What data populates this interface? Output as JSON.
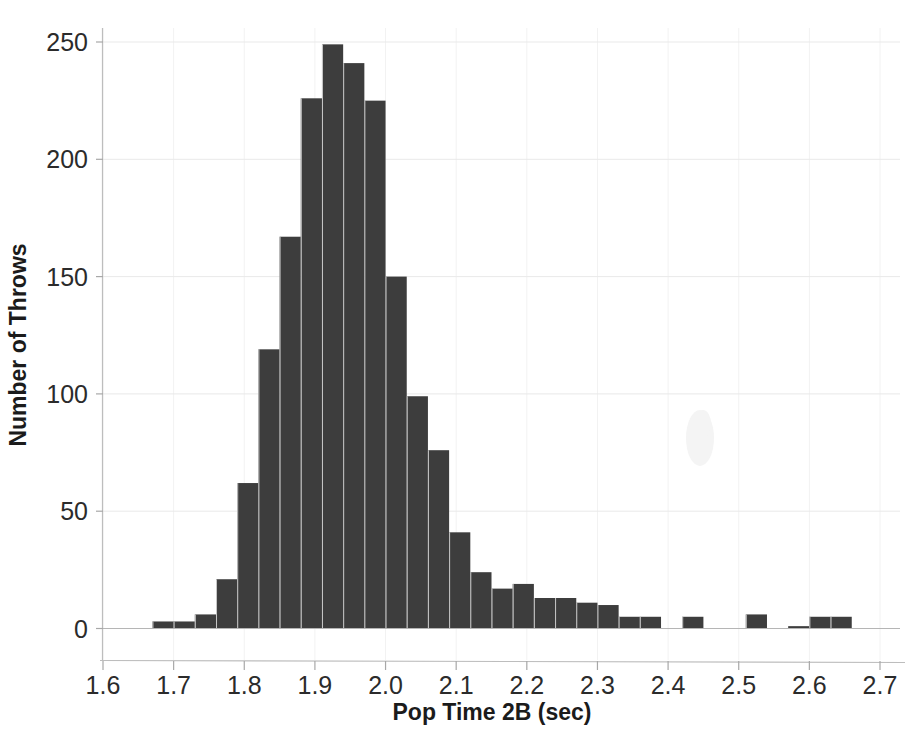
{
  "chart_data": {
    "type": "bar",
    "title": "",
    "subtitle": "",
    "xlabel": "Pop Time 2B (sec)",
    "ylabel": "Number of Throws",
    "xlim": [
      1.6,
      2.7
    ],
    "ylim": [
      0,
      262
    ],
    "bin_width": 0.03,
    "grid": true,
    "legend": null,
    "legend_position": "none",
    "x_ticks": [
      "1.6",
      "1.7",
      "1.8",
      "1.9",
      "2.0",
      "2.1",
      "2.2",
      "2.3",
      "2.4",
      "2.5",
      "2.6",
      "2.7"
    ],
    "x_tick_values": [
      1.6,
      1.7,
      1.8,
      1.9,
      2.0,
      2.1,
      2.2,
      2.3,
      2.4,
      2.5,
      2.6,
      2.7
    ],
    "y_ticks": [
      "0",
      "50",
      "100",
      "150",
      "200",
      "250"
    ],
    "y_tick_values": [
      0,
      50,
      100,
      150,
      200,
      250
    ],
    "bin_edges": [
      1.67,
      1.7,
      1.73,
      1.76,
      1.79,
      1.82,
      1.85,
      1.88,
      1.91,
      1.94,
      1.97,
      2.0,
      2.03,
      2.06,
      2.09,
      2.12,
      2.15,
      2.18,
      2.21,
      2.24,
      2.27,
      2.3,
      2.33,
      2.36,
      2.39,
      2.42,
      2.45,
      2.48,
      2.51,
      2.54,
      2.57,
      2.6,
      2.63,
      2.66
    ],
    "categories": [
      "1.67-1.70",
      "1.70-1.73",
      "1.73-1.76",
      "1.76-1.79",
      "1.79-1.82",
      "1.82-1.85",
      "1.85-1.88",
      "1.88-1.91",
      "1.91-1.94",
      "1.94-1.97",
      "1.97-2.00",
      "2.00-2.03",
      "2.03-2.06",
      "2.06-2.09",
      "2.09-2.12",
      "2.12-2.15",
      "2.15-2.18",
      "2.18-2.21",
      "2.21-2.24",
      "2.24-2.27",
      "2.27-2.30",
      "2.30-2.33",
      "2.33-2.36",
      "2.36-2.39",
      "2.39-2.42",
      "2.42-2.45",
      "2.45-2.48",
      "2.48-2.51",
      "2.51-2.54",
      "2.54-2.57",
      "2.57-2.60",
      "2.60-2.63",
      "2.63-2.66"
    ],
    "values": [
      3,
      3,
      6,
      21,
      62,
      119,
      167,
      226,
      249,
      241,
      225,
      150,
      99,
      76,
      41,
      24,
      17,
      19,
      13,
      13,
      11,
      10,
      5,
      5,
      0,
      5,
      0,
      0,
      6,
      0,
      1,
      5,
      5
    ]
  },
  "figure": {
    "background_color": "#ffffff",
    "bar_color": "#3d3d3d",
    "grid_color": "#e9e9e9",
    "axis_color": "#bdbdbd",
    "text_color": "#231f20"
  }
}
